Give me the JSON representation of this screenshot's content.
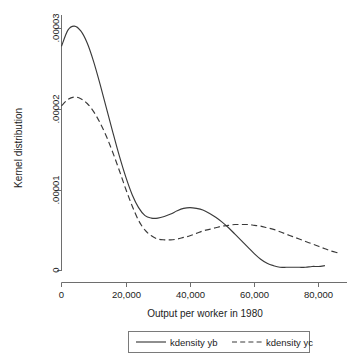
{
  "chart_data": {
    "type": "line",
    "title": "",
    "subtitle": "",
    "xlabel": "Output per worker in 1980",
    "ylabel": "Kernel distribution",
    "xlim": [
      0,
      88000
    ],
    "ylim": [
      0,
      3.15e-05
    ],
    "grid": false,
    "legend_position": "bottom",
    "xticks": [
      0,
      20000,
      40000,
      60000,
      80000
    ],
    "xtick_labels": [
      "0",
      "20,000",
      "40,000",
      "60,000",
      "80,000"
    ],
    "yticks": [
      0,
      1e-05,
      2e-05,
      3e-05
    ],
    "ytick_labels": [
      "0",
      ".00001",
      ".00002",
      ".00003"
    ],
    "series": [
      {
        "name": "kdensity yb",
        "style": "solid",
        "color": "#3a3a3a",
        "x": [
          0,
          2000,
          4000,
          6000,
          8000,
          10000,
          12000,
          14000,
          16000,
          18000,
          20000,
          22000,
          24000,
          26000,
          28000,
          30000,
          32000,
          34000,
          36000,
          38000,
          40000,
          42000,
          44000,
          46000,
          48000,
          50000,
          52000,
          54000,
          56000,
          58000,
          60000,
          62000,
          64000,
          66000,
          68000,
          70000,
          72000,
          74000,
          76000,
          78000,
          80000,
          82000
        ],
        "y": [
          2.78e-05,
          2.98e-05,
          3.03e-05,
          2.97e-05,
          2.82e-05,
          2.59e-05,
          2.31e-05,
          2.01e-05,
          1.71e-05,
          1.42e-05,
          1.16e-05,
          9.4e-06,
          7.8e-06,
          6.8e-06,
          6.5e-06,
          6.5e-06,
          6.7e-06,
          7e-06,
          7.4e-06,
          7.7e-06,
          7.8e-06,
          7.7e-06,
          7.5e-06,
          7.1e-06,
          6.6e-06,
          6e-06,
          5.3e-06,
          4.5e-06,
          3.7e-06,
          2.9e-06,
          2.1e-06,
          1.4e-06,
          9e-07,
          6e-07,
          4e-07,
          4e-07,
          4e-07,
          4e-07,
          4e-07,
          5e-07,
          5e-07,
          6e-07
        ]
      },
      {
        "name": "kdensity yc",
        "style": "dashed",
        "color": "#3a3a3a",
        "x": [
          0,
          2000,
          4000,
          6000,
          8000,
          10000,
          12000,
          14000,
          16000,
          18000,
          20000,
          22000,
          24000,
          26000,
          28000,
          30000,
          32000,
          34000,
          36000,
          38000,
          40000,
          42000,
          44000,
          46000,
          48000,
          50000,
          52000,
          54000,
          56000,
          58000,
          60000,
          62000,
          64000,
          66000,
          68000,
          70000,
          72000,
          74000,
          76000,
          78000,
          80000,
          82000,
          84000,
          86000
        ],
        "y": [
          2.04e-05,
          2.12e-05,
          2.15e-05,
          2.13e-05,
          2.07e-05,
          1.97e-05,
          1.83e-05,
          1.66e-05,
          1.46e-05,
          1.24e-05,
          1.01e-05,
          8e-06,
          6.2e-06,
          5e-06,
          4.3e-06,
          3.9e-06,
          3.8e-06,
          3.8e-06,
          3.9e-06,
          4.1e-06,
          4.3e-06,
          4.6e-06,
          4.9e-06,
          5.1e-06,
          5.3e-06,
          5.5e-06,
          5.6e-06,
          5.7e-06,
          5.7e-06,
          5.7e-06,
          5.6e-06,
          5.5e-06,
          5.3e-06,
          5.1e-06,
          4.8e-06,
          4.5e-06,
          4.2e-06,
          3.9e-06,
          3.6e-06,
          3.3e-06,
          3e-06,
          2.7e-06,
          2.4e-06,
          2.2e-06
        ]
      }
    ],
    "annotations": []
  },
  "legend": {
    "entries": [
      {
        "label": "kdensity yb",
        "style": "solid"
      },
      {
        "label": "kdensity yc",
        "style": "dashed"
      }
    ]
  }
}
